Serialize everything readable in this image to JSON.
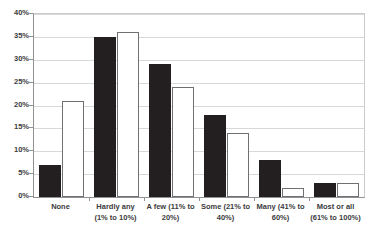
{
  "chart_data": {
    "type": "bar",
    "title": "",
    "xlabel": "",
    "ylabel": "",
    "ylim": [
      0,
      40
    ],
    "ytick_labels": [
      "40%",
      "35%",
      "30%",
      "25%",
      "20%",
      "15%",
      "10%",
      "5%",
      "0%"
    ],
    "ytick_values": [
      40,
      35,
      30,
      25,
      20,
      15,
      10,
      5,
      0
    ],
    "grid": true,
    "legend": "none",
    "categories": [
      "None",
      "Hardly any (1% to 10%)",
      "A few (11% to 20%)",
      "Some (21% to 40%)",
      "Many (41% to 60%)",
      "Most or all (61% to 100%)"
    ],
    "category_lines": [
      [
        "None"
      ],
      [
        "Hardly any",
        "(1% to 10%)"
      ],
      [
        "A few (11% to",
        "20%)"
      ],
      [
        "Some (21% to",
        "40%)"
      ],
      [
        "Many (41% to",
        "60%)"
      ],
      [
        "Most or all",
        "(61% to 100%)"
      ]
    ],
    "series": [
      {
        "name": "Series 1",
        "color": "#231f20",
        "style": "filled-black",
        "values": [
          7,
          35,
          29,
          18,
          8,
          3
        ]
      },
      {
        "name": "Series 2",
        "color": "#ffffff",
        "style": "white-outlined",
        "values": [
          21,
          36,
          24,
          14,
          2,
          3
        ]
      }
    ]
  },
  "axis": {
    "y_max_label": "40%",
    "y_min_label": "0%"
  }
}
